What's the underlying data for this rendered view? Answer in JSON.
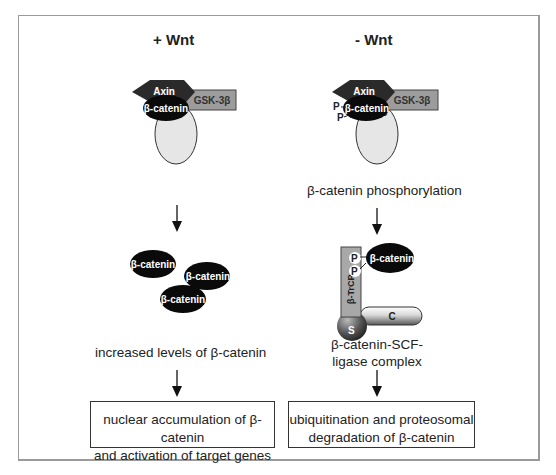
{
  "colors": {
    "axin": "#2a2a2a",
    "gsk3b": "#9c9c9c",
    "beta_catenin": "#0a0a0a",
    "apc": "#e6e6e6",
    "btrcp": "#a8a8a8",
    "frame": "#9a9a9a"
  },
  "left_panel": {
    "title": "+ Wnt",
    "complex": {
      "axin": "Axin",
      "gsk3b": "GSK-3β",
      "beta_catenin": "β-catenin",
      "apc": "APC"
    },
    "free_beta_catenin": [
      "β-catenin",
      "β-catenin",
      "β-catenin"
    ],
    "step_label": "increased levels of β-catenin",
    "outcome": {
      "line1": "nuclear accumulation of β-catenin",
      "line2": "and activation of target genes"
    }
  },
  "right_panel": {
    "title": "- Wnt",
    "complex": {
      "axin": "Axin",
      "gsk3b": "GSK-3β",
      "beta_catenin": "β-catenin",
      "apc": "APC",
      "phospho1": "P",
      "phospho2": "P"
    },
    "step_label": "β-catenin phosphorylation",
    "scf_complex": {
      "beta_catenin": "β-catenin",
      "phospho1": "P",
      "phospho2": "P",
      "btrcp": "β-TrCP",
      "skp1": "S",
      "cullin": "C"
    },
    "complex_label": {
      "line1": "β-catenin-SCF-",
      "line2": "ligase complex"
    },
    "outcome": {
      "line1": "ubiquitination and proteosomal",
      "line2": "degradation of β-catenin"
    }
  }
}
